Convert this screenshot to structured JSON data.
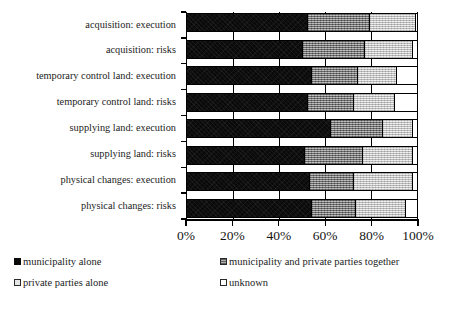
{
  "chart_data": {
    "type": "bar",
    "orientation": "horizontal",
    "stacked": true,
    "title": "",
    "xlabel": "",
    "ylabel": "",
    "xlim": [
      0,
      100
    ],
    "grid": true,
    "legend_position": "bottom",
    "tick_labels": [
      "0%",
      "20%",
      "40%",
      "60%",
      "80%",
      "100%"
    ],
    "tick_values": [
      0,
      20,
      40,
      60,
      80,
      100
    ],
    "categories": [
      "acquisition: execution",
      "acquisition: risks",
      "temporary control land: execution",
      "temporary control land: risks",
      "supplying land: execution",
      "supplying land: risks",
      "physical changes: execution",
      "physical changes: risks"
    ],
    "series": [
      {
        "name": "municipality alone",
        "color": "#0a0a0a",
        "values": [
          52,
          50,
          54,
          52,
          62,
          51,
          53,
          54
        ]
      },
      {
        "name": "municipality and private parties together",
        "color": "#8e8e8e",
        "values": [
          27,
          27,
          20,
          20,
          23,
          25,
          19,
          19
        ]
      },
      {
        "name": "private parties alone",
        "color": "#d5d5d5",
        "values": [
          20,
          21,
          17,
          18,
          13,
          22,
          26,
          22
        ]
      },
      {
        "name": "unknown",
        "color": "#ffffff",
        "values": [
          1,
          2,
          9,
          10,
          2,
          2,
          2,
          5
        ]
      }
    ]
  },
  "legend": {
    "items": [
      {
        "label": "municipality alone",
        "swatch": "muni"
      },
      {
        "label": "municipality and private parties together",
        "swatch": "both"
      },
      {
        "label": "private parties alone",
        "swatch": "priv"
      },
      {
        "label": "unknown",
        "swatch": "unk"
      }
    ]
  }
}
